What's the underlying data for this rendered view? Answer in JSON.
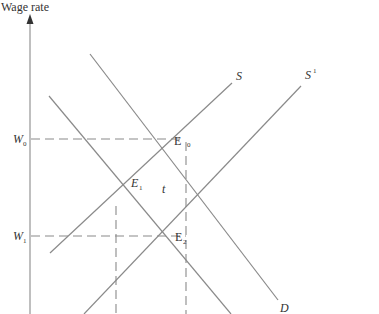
{
  "diagram": {
    "y_axis_label": "Wage rate",
    "curves": {
      "supply": "S",
      "supply_shifted_main": "S",
      "supply_shifted_sup": "1",
      "demand": "D"
    },
    "points": {
      "e0_main": "E",
      "e0_sub": "0",
      "e1_main": "E",
      "e1_sub": "1",
      "e2_main": "E",
      "e2_sub": "2"
    },
    "wages": {
      "w0_main": "W",
      "w0_sub": "0",
      "w1_main": "W",
      "w1_sub": "1"
    },
    "tax_label": "t"
  },
  "colors": {
    "lines": "#8a8a8a",
    "text": "#333333",
    "background": "#ffffff"
  }
}
